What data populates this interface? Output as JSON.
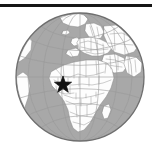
{
  "figure": {
    "caption": "Orthographic globe centered on Africa and Europe with a star marker",
    "width": 159,
    "height": 159,
    "background_color": "#ffffff"
  },
  "top_rule": {
    "name": "horizontal rule",
    "color": "#161616",
    "x": 0,
    "y": 4,
    "width": 152,
    "height": 3
  },
  "globe": {
    "projection": "orthographic",
    "center_x": 80,
    "center_y": 77,
    "radius": 64,
    "ocean_color": "#a8a8a8",
    "land_color": "#fdfdfd",
    "border_color": "#8f8f8f",
    "outline_color": "#6e6e6e",
    "graticule_color": "#9a9a9a",
    "graticule_spacing_degrees": 20,
    "center_longitude": 15,
    "center_latitude": 10,
    "continents_visible": [
      "Africa",
      "Europe",
      "Asia",
      "South America",
      "Greenland"
    ]
  },
  "marker": {
    "type": "star",
    "label": "location marker",
    "color": "#111111",
    "center_x": 63,
    "center_y": 85,
    "size": 18,
    "points": 5,
    "region": "West Africa"
  },
  "chart_data": {
    "type": "map",
    "projection": "orthographic",
    "markers": [
      {
        "label": "",
        "symbol": "star",
        "region": "West Africa",
        "x_px": 63,
        "y_px": 85
      }
    ],
    "legend": [],
    "annotations": []
  }
}
